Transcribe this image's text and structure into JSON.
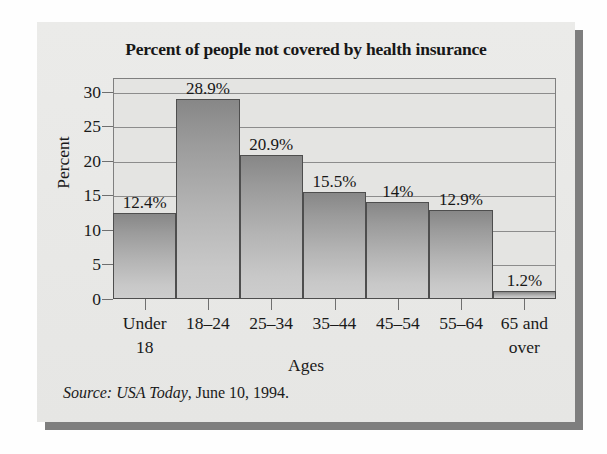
{
  "chart_data": {
    "type": "bar",
    "title": "Percent of people not covered by health insurance",
    "xlabel": "Ages",
    "ylabel": "Percent",
    "ylim": [
      0,
      32
    ],
    "yticks": [
      0,
      5,
      10,
      15,
      20,
      25,
      30
    ],
    "ytick_labels": [
      "0",
      "5",
      "10",
      "15",
      "20",
      "25",
      "30"
    ],
    "grid": true,
    "legend": "none",
    "categories": [
      "Under 18",
      "18–24",
      "25–34",
      "35–44",
      "45–54",
      "55–64",
      "65 and over"
    ],
    "category_lines": [
      [
        "Under",
        "18"
      ],
      [
        "18–24"
      ],
      [
        "25–34"
      ],
      [
        "35–44"
      ],
      [
        "45–54"
      ],
      [
        "55–64"
      ],
      [
        "65 and",
        "over"
      ]
    ],
    "values": [
      12.4,
      28.9,
      20.9,
      15.5,
      14,
      12.9,
      1.2
    ],
    "data_labels": [
      "12.4%",
      "28.9%",
      "20.9%",
      "15.5%",
      "14%",
      "12.9%",
      "1.2%"
    ],
    "bar_color_top": "#878787",
    "bar_color_bottom": "#cdcdcd",
    "bar_edge_color": "#4e4e4e",
    "plot_background": "#e4e4e2",
    "gridline_color": "#8c8c8c",
    "panel_background": "#e9e9e7",
    "shadow_color": "#7e7e7e"
  },
  "source_note": {
    "italic_part": "Source: USA Today",
    "rest_part": ", June 10, 1994."
  }
}
